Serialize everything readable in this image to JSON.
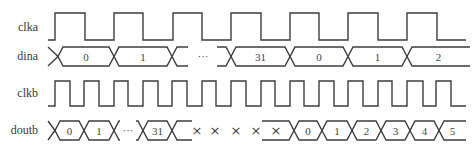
{
  "diagram": {
    "colors": {
      "line": "#3c3c3c",
      "text": "#3a3a3a",
      "background": "#ffffff"
    },
    "signals": [
      {
        "name": "clka",
        "type": "clock",
        "label": "clka",
        "label_y": 31,
        "high_y": 13,
        "low_y": 40,
        "start_x": 48,
        "end_x": 466,
        "edges": [
          55,
          85,
          114,
          143,
          173,
          202,
          231,
          261,
          290,
          319,
          348,
          378,
          407,
          437
        ]
      },
      {
        "name": "dina",
        "type": "bus",
        "label": "dina",
        "label_y": 60,
        "top_y": 47,
        "bottom_y": 66,
        "segments": [
          {
            "kind": "lead",
            "from": 48,
            "to": 58
          },
          {
            "kind": "value",
            "from": 58,
            "to": 114,
            "text": "0"
          },
          {
            "kind": "value",
            "from": 114,
            "to": 172,
            "text": "1"
          },
          {
            "kind": "lead-out",
            "from": 172,
            "to": 188
          },
          {
            "kind": "gap",
            "at": 203,
            "text": "···"
          },
          {
            "kind": "lead-in",
            "from": 217,
            "to": 231
          },
          {
            "kind": "value",
            "from": 231,
            "to": 290,
            "text": "31"
          },
          {
            "kind": "value",
            "from": 290,
            "to": 348,
            "text": "0"
          },
          {
            "kind": "value",
            "from": 348,
            "to": 407,
            "text": "1"
          },
          {
            "kind": "value",
            "from": 407,
            "to": 470,
            "text": "2",
            "open_end": true
          }
        ]
      },
      {
        "name": "clkb",
        "type": "clock",
        "label": "clkb",
        "label_y": 97,
        "high_y": 81,
        "low_y": 106,
        "start_x": 48,
        "end_x": 466,
        "edges": [
          55,
          70,
          84,
          99,
          114,
          128,
          143,
          158,
          172,
          187,
          202,
          216,
          231,
          246,
          261,
          275,
          290,
          304,
          319,
          334,
          348,
          363,
          378,
          392,
          407,
          423,
          436,
          451
        ]
      },
      {
        "name": "doutb",
        "type": "bus",
        "label": "doutb",
        "label_y": 134,
        "top_y": 121,
        "bottom_y": 140,
        "segments": [
          {
            "kind": "lead",
            "from": 48,
            "to": 55
          },
          {
            "kind": "value",
            "from": 55,
            "to": 84,
            "text": "0"
          },
          {
            "kind": "value",
            "from": 84,
            "to": 114,
            "text": "1"
          },
          {
            "kind": "lead-out",
            "from": 114,
            "to": 120
          },
          {
            "kind": "gap",
            "at": 128,
            "text": "···"
          },
          {
            "kind": "lead-in",
            "from": 136,
            "to": 143
          },
          {
            "kind": "value",
            "from": 143,
            "to": 172,
            "text": "31"
          },
          {
            "kind": "lead-out",
            "from": 172,
            "to": 192
          },
          {
            "kind": "lead-in-flat",
            "from": 262,
            "to": 294
          },
          {
            "kind": "value",
            "from": 294,
            "to": 322,
            "text": "0"
          },
          {
            "kind": "value",
            "from": 322,
            "to": 352,
            "text": "1"
          },
          {
            "kind": "value",
            "from": 352,
            "to": 381,
            "text": "2"
          },
          {
            "kind": "value",
            "from": 381,
            "to": 410,
            "text": "3"
          },
          {
            "kind": "value",
            "from": 410,
            "to": 439,
            "text": "4"
          },
          {
            "kind": "value",
            "from": 439,
            "to": 466,
            "text": "5",
            "open_end": true
          }
        ],
        "unknown_marks": {
          "text": "×",
          "x": [
            197,
            215,
            236,
            256,
            276
          ],
          "y": 135
        }
      }
    ]
  }
}
